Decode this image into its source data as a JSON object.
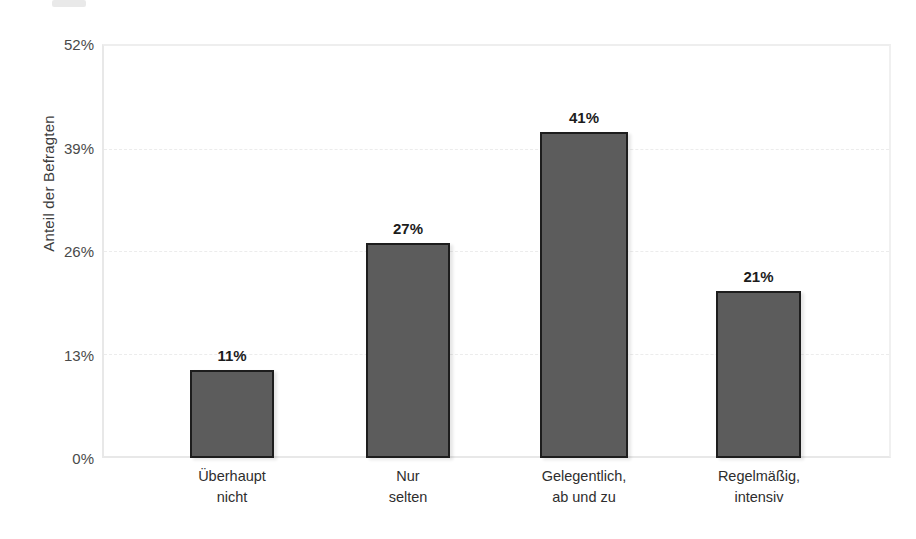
{
  "chart_data": {
    "type": "bar",
    "title": "",
    "subtitle": "",
    "xlabel": "",
    "ylabel": "Anteil der Befragten",
    "categories": [
      "Überhaupt nicht",
      "Nur selten",
      "Gelegentlich, ab und zu",
      "Regelmäßig, intensiv"
    ],
    "category_lines": [
      [
        "Überhaupt",
        "nicht"
      ],
      [
        "Nur",
        "selten"
      ],
      [
        "Gelegentlich,",
        "ab und zu"
      ],
      [
        "Regelmäßig,",
        "intensiv"
      ]
    ],
    "values": [
      11,
      27,
      41,
      21
    ],
    "value_labels": [
      "11%",
      "27%",
      "41%",
      "21%"
    ],
    "ylim": [
      0,
      52
    ],
    "ytick_values": [
      0,
      13,
      26,
      39,
      52
    ],
    "ytick_labels": [
      "0%",
      "13%",
      "26%",
      "39%",
      "52%"
    ],
    "grid": true,
    "legend": "none",
    "bar_color": "#5c5c5c",
    "bar_border_color": "#1d1d1d",
    "gridline_color": "#ececec",
    "axis_color": "#e8e8e8"
  },
  "watermark": {
    "text": "statista",
    "mark": "⌐"
  }
}
